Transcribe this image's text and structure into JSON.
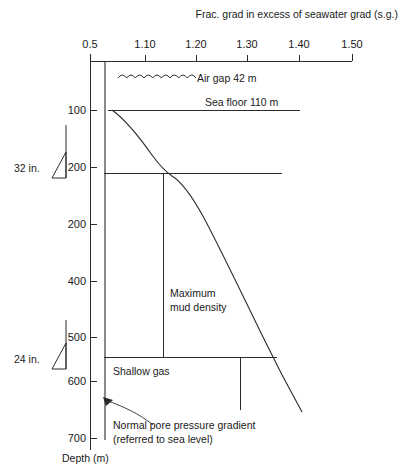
{
  "chart_data": {
    "type": "line",
    "title": "",
    "xlabel": "Frac. grad in excess of seawater grad (s.g.)",
    "ylabel": "Depth (m)",
    "grid": false,
    "legend": "none",
    "xlim": [
      0.5,
      1.5
    ],
    "ylim": [
      0,
      750
    ],
    "x_ticks": [
      {
        "label": "0.5",
        "x": 0.5,
        "px": 90
      },
      {
        "label": "1.10",
        "x": 1.1,
        "px": 145
      },
      {
        "label": "1.20",
        "x": 1.2,
        "px": 196
      },
      {
        "label": "1.30",
        "x": 1.3,
        "px": 247
      },
      {
        "label": "1.40",
        "x": 1.4,
        "px": 299
      },
      {
        "label": "1.50",
        "x": 1.5,
        "px": 352
      }
    ],
    "y_ticks": [
      {
        "label": "100",
        "y": 100,
        "px": 110
      },
      {
        "label": "200",
        "y": 200,
        "px": 167
      },
      {
        "label": "200",
        "y": 300,
        "px": 224
      },
      {
        "label": "400",
        "y": 400,
        "px": 281
      },
      {
        "label": "500",
        "y": 500,
        "px": 337
      },
      {
        "label": "600",
        "y": 600,
        "px": 381
      },
      {
        "label": "700",
        "y": 700,
        "px": 438
      }
    ],
    "series": [
      {
        "name": "Fracture gradient curve",
        "path": "M 112,110 C 126,120 140,138 152,155 C 160,166 166,172 172,176 C 182,182 192,196 204,218 C 220,248 240,290 262,335 C 278,368 292,394 302,412"
      },
      {
        "name": "Normal pore pressure gradient",
        "path": "M 105,61 L 105,440"
      }
    ],
    "reference_lines": [
      {
        "name": "sea-floor-line",
        "x1": 108,
        "y1": 110,
        "x2": 300,
        "y2": 110
      },
      {
        "name": "casing-shoe-32in-line",
        "x1": 104,
        "y1": 173,
        "x2": 282,
        "y2": 173
      },
      {
        "name": "shallow-gas-top-line",
        "x1": 104,
        "y1": 357,
        "x2": 277,
        "y2": 357
      },
      {
        "name": "mud-density-vertical",
        "x1": 163,
        "y1": 173,
        "x2": 163,
        "y2": 357
      },
      {
        "name": "shallow-gas-vertical",
        "x1": 240,
        "y1": 357,
        "x2": 240,
        "y2": 410
      }
    ]
  },
  "axis": {
    "top_title": "Frac. grad in excess of seawater grad (s.g.)",
    "depth_title": "Depth (m)"
  },
  "annotations": {
    "air_gap": "Air gap 42 m",
    "sea_floor": "Sea floor 110 m",
    "max_mud_density_line1": "Maximum",
    "max_mud_density_line2": "mud density",
    "shallow_gas": "Shallow gas",
    "pore_pressure_line1": "Normal pore pressure gradient",
    "pore_pressure_line2": "(referred to sea level)"
  },
  "casings": [
    {
      "label": "32 in.",
      "label_x": 14,
      "label_y": 172,
      "stem_x": 66,
      "stem_top": 125,
      "stem_bottom": 178,
      "shoe": "M 52,178 L 66,152 L 66,178 Z"
    },
    {
      "label": "24 in.",
      "label_x": 14,
      "label_y": 363,
      "stem_x": 66,
      "stem_top": 320,
      "stem_bottom": 369,
      "shoe": "M 52,369 L 66,343 L 66,369 Z"
    }
  ],
  "colors": {
    "ink": "#2b2b2b",
    "background": "#ffffff"
  }
}
